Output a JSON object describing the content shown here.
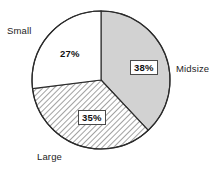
{
  "chart_data": {
    "type": "pie",
    "title": "",
    "categories": [
      "Midsize",
      "Large",
      "Small"
    ],
    "values": [
      38,
      35,
      27
    ],
    "value_labels": [
      "38%",
      "35%",
      "27%"
    ],
    "units": "percent",
    "start_angle_deg": 0,
    "direction": "clockwise",
    "legend": "none",
    "grid": false,
    "slices": [
      {
        "name": "Midsize",
        "value": 38,
        "value_label": "38%",
        "fill_style": "solid-gray",
        "fill_color": "#d2d2d2",
        "edge_color": "#2b2b2b",
        "label_boxed": true,
        "start_deg": 0,
        "end_deg": 136.8
      },
      {
        "name": "Large",
        "value": 35,
        "value_label": "35%",
        "fill_style": "diagonal-hatch",
        "fill_color": "#ffffff",
        "hatch_color": "#555555",
        "edge_color": "#2b2b2b",
        "label_boxed": true,
        "start_deg": 136.8,
        "end_deg": 262.8
      },
      {
        "name": "Small",
        "value": 27,
        "value_label": "27%",
        "fill_style": "plain-white",
        "fill_color": "#ffffff",
        "edge_color": "#2b2b2b",
        "label_boxed": false,
        "start_deg": 262.8,
        "end_deg": 360
      }
    ],
    "geometry": {
      "center_x": 101,
      "center_y": 80,
      "radius": 69
    }
  },
  "labels": {
    "small": "Small",
    "midsize": "Midsize",
    "large": "Large"
  },
  "values": {
    "small": "27%",
    "midsize": "38%",
    "large": "35%"
  },
  "colors": {
    "background": "#ffffff",
    "outline": "#2b2b2b",
    "midsize_fill": "#d2d2d2",
    "large_hatch": "#555555",
    "text": "#1d1d1d"
  }
}
